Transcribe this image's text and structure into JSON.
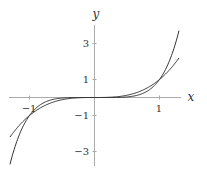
{
  "chart_data": {
    "type": "line",
    "title": "",
    "xlabel": "x",
    "ylabel": "y",
    "xlim": [
      -1.3,
      1.3
    ],
    "ylim": [
      -3.8,
      3.9
    ],
    "grid": false,
    "legend": null,
    "x_ticks": [
      "-1",
      "1"
    ],
    "y_ticks": [
      "3",
      "1",
      "-1",
      "-3"
    ],
    "series": [
      {
        "name": "y = x^3",
        "x": [
          -1.3,
          -1,
          -0.5,
          0,
          0.5,
          1,
          1.3
        ],
        "values": [
          -2.197,
          -1,
          -0.125,
          0,
          0.125,
          1,
          2.197
        ]
      },
      {
        "name": "y = x^5",
        "x": [
          -1.3,
          -1,
          -0.5,
          0,
          0.5,
          1,
          1.3
        ],
        "values": [
          -3.713,
          -1,
          -0.031,
          0,
          0.031,
          1,
          3.713
        ]
      }
    ],
    "annotations": [
      "curves intersect at (-1,-1), (0,0), (1,1)"
    ]
  },
  "axes": {
    "x_label": "x",
    "y_label": "y",
    "x_tick_labels": [
      "−1",
      "1"
    ],
    "y_tick_labels": [
      "3",
      "1",
      "−1",
      "−3"
    ]
  },
  "colors": {
    "curve": "#333333",
    "axis": "#aaaaaa"
  }
}
